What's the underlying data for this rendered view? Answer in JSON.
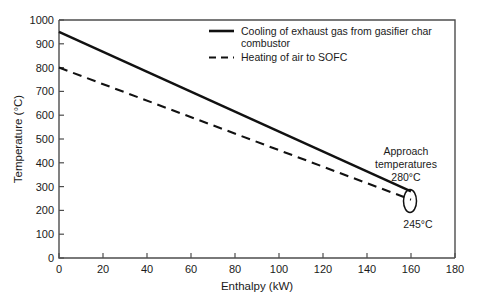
{
  "chart_data": {
    "type": "line",
    "title": "",
    "xlabel": "Enthalpy (kW)",
    "ylabel": "Temperature (°C)",
    "xlim": [
      0,
      180
    ],
    "ylim": [
      0,
      1000
    ],
    "xticks": [
      0,
      20,
      40,
      60,
      80,
      100,
      120,
      140,
      160,
      180
    ],
    "yticks": [
      0,
      100,
      200,
      300,
      400,
      500,
      600,
      700,
      800,
      900,
      1000
    ],
    "grid": false,
    "legend_position": "top-right inside",
    "series": [
      {
        "name": "Cooling of exhaust gas from gasifier char combustor",
        "style": "solid",
        "color": "#111111",
        "x": [
          0,
          160
        ],
        "y": [
          950,
          280
        ]
      },
      {
        "name": "Heating of air to SOFC",
        "style": "dashed",
        "color": "#111111",
        "x": [
          0,
          160
        ],
        "y": [
          800,
          245
        ]
      }
    ],
    "annotations": [
      {
        "name": "approach-temperatures",
        "lines": [
          "Approach",
          "temperatures",
          "280°C"
        ],
        "marker": "ellipse"
      },
      {
        "name": "lower-approach-temperature",
        "lines": [
          "245°C"
        ],
        "marker": "none"
      }
    ]
  },
  "axes": {
    "x": {
      "title": "Enthalpy (kW)",
      "tick_labels": [
        "0",
        "20",
        "40",
        "60",
        "80",
        "100",
        "120",
        "140",
        "160",
        "180"
      ]
    },
    "y": {
      "title": "Temperature (°C)",
      "tick_labels": [
        "0",
        "100",
        "200",
        "300",
        "400",
        "500",
        "600",
        "700",
        "800",
        "900",
        "1000"
      ]
    }
  },
  "legend": {
    "entries": [
      {
        "line1": "Cooling of exhaust gas from gasifier char",
        "line2": "combustor",
        "style": "solid"
      },
      {
        "line1": "Heating of air to SOFC",
        "line2": "",
        "style": "dashed"
      }
    ]
  },
  "annotation": {
    "title_line1": "Approach",
    "title_line2": "temperatures",
    "upper_value": "280°C",
    "lower_value": "245°C"
  },
  "colors": {
    "series": "#111111",
    "axis": "#4d4d4d",
    "background": "#ffffff",
    "text": "#1a1a1a"
  }
}
